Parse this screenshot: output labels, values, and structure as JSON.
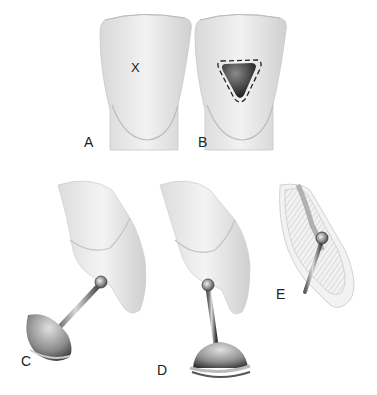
{
  "figure": {
    "panels": [
      {
        "id": "A",
        "label": "A",
        "marker": "X",
        "description": "incisor lingual view with access point marked"
      },
      {
        "id": "B",
        "label": "B",
        "description": "incisor lingual view with triangular access outline"
      },
      {
        "id": "C",
        "label": "C",
        "description": "round bur on handpiece entering lingual surface, angled"
      },
      {
        "id": "D",
        "label": "D",
        "description": "round bur on handpiece entering lingual surface, vertical"
      },
      {
        "id": "E",
        "label": "E",
        "description": "cross-section with bur in pulp chamber"
      }
    ],
    "colors": {
      "tooth": "#ececec",
      "tooth_shade": "#c8c8c8",
      "cavity": "#3a3a3a",
      "metal": "#8a8a8a",
      "outline": "#222222"
    }
  }
}
